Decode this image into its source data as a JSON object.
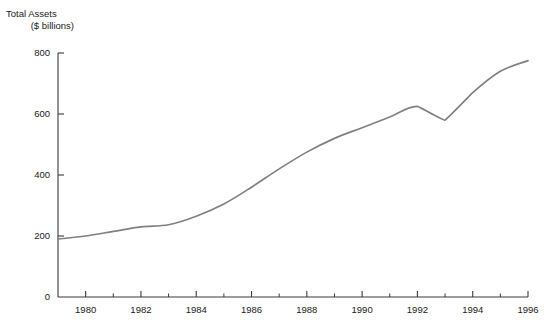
{
  "chart_data": {
    "type": "line",
    "title": "",
    "ylabel": "Total Assets\n($ billions)",
    "ylabel_line1": "Total Assets",
    "ylabel_line2": "($ billions)",
    "xlabel": "",
    "xlim": [
      1979,
      1996
    ],
    "ylim": [
      0,
      800
    ],
    "ytick_labels": [
      "0",
      "200",
      "400",
      "600",
      "800"
    ],
    "ytick_values": [
      0,
      200,
      400,
      600,
      800
    ],
    "xtick_labels": [
      "1980",
      "1982",
      "1984",
      "1986",
      "1988",
      "1990",
      "1992",
      "1994",
      "1996"
    ],
    "xtick_values": [
      1980,
      1982,
      1984,
      1986,
      1988,
      1990,
      1992,
      1994,
      1996
    ],
    "x_minor_ticks": [
      1981,
      1983,
      1985,
      1987,
      1989,
      1991,
      1993,
      1995
    ],
    "grid": false,
    "legend": false,
    "line_color": "#808080",
    "axis_color": "#3a3a3a",
    "x": [
      1979,
      1980,
      1981,
      1982,
      1983,
      1984,
      1985,
      1986,
      1987,
      1988,
      1989,
      1990,
      1991,
      1992,
      1993,
      1994,
      1995,
      1996
    ],
    "values": [
      190,
      200,
      215,
      230,
      237,
      265,
      305,
      360,
      420,
      475,
      520,
      555,
      590,
      625,
      580,
      670,
      740,
      775
    ],
    "series": [
      {
        "name": "Total Assets",
        "values": [
          190,
          200,
          215,
          230,
          237,
          265,
          305,
          360,
          420,
          475,
          520,
          555,
          590,
          625,
          580,
          670,
          740,
          775
        ]
      }
    ]
  }
}
